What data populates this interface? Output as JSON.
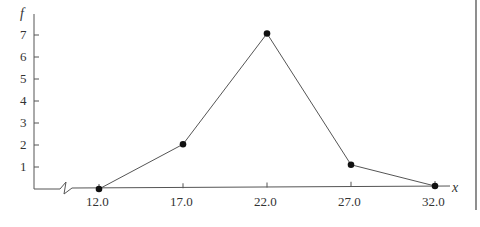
{
  "chart_data": {
    "type": "line",
    "title": "",
    "xlabel": "x",
    "ylabel": "f",
    "x": [
      12.0,
      17.0,
      22.0,
      27.0,
      32.0
    ],
    "categories": [
      "12.0",
      "17.0",
      "22.0",
      "27.0",
      "32.0"
    ],
    "values": [
      0,
      2,
      7,
      1,
      0
    ],
    "y_ticks": [
      "1",
      "2",
      "3",
      "4",
      "5",
      "6",
      "7"
    ],
    "ylim": [
      0,
      7
    ],
    "xlim": [
      12.0,
      32.0
    ],
    "grid": false,
    "axis_break": true,
    "markers": "filled-circle"
  },
  "labels": {
    "xlabel": "x",
    "ylabel": "f",
    "xticks": [
      "12.0",
      "17.0",
      "22.0",
      "27.0",
      "32.0"
    ],
    "yticks": [
      "1",
      "2",
      "3",
      "4",
      "5",
      "6",
      "7"
    ]
  }
}
